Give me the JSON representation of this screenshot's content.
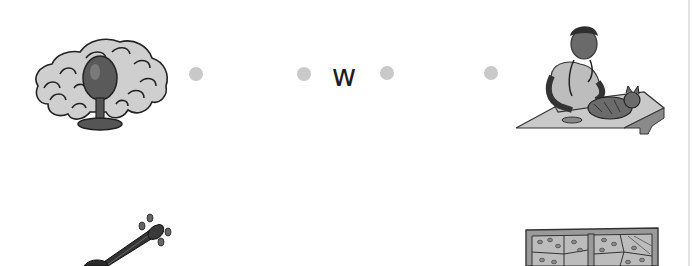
{
  "worksheet": {
    "row1": {
      "left_picture": {
        "name": "wig",
        "icon": "wig-on-stand-icon"
      },
      "letter": "w",
      "right_picture": {
        "name": "vet",
        "icon": "vet-examining-cat-icon"
      }
    },
    "row2": {
      "left_picture": {
        "name": "violin",
        "icon": "violin-icon"
      },
      "right_picture": {
        "name": "window",
        "icon": "window-icon"
      }
    }
  },
  "colors": {
    "dot": "#c9c9c9",
    "letter": "#1e1e1e",
    "background": "#ffffff"
  }
}
